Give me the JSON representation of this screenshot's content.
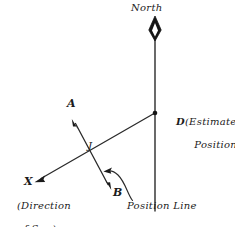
{
  "figure": {
    "background_color": "#ffffff",
    "ink_color": "#1b1b1b",
    "width": 235,
    "height": 227
  },
  "labels": {
    "north": "North",
    "point_a": "A",
    "point_j": "J",
    "point_b": "B",
    "point_x": "X",
    "point_d_letter": "D",
    "point_d_paren_line1": "(Estimated",
    "point_d_paren_line2": "Position)",
    "sun_line1": "(Direction",
    "sun_line2": "of Sun)",
    "position_line": "Position Line"
  },
  "geometry": {
    "north_line": {
      "x": 155,
      "y_top": 36,
      "y_bottom": 211
    },
    "compass_needle": {
      "cx": 155,
      "cy_top": 17,
      "cy_bottom": 40,
      "half_width": 6
    },
    "point_d": {
      "x": 155,
      "y": 113
    },
    "point_j": {
      "x": 95,
      "y": 155
    },
    "sun_ray": {
      "x1": 155,
      "y1": 113,
      "x2": 35,
      "y2": 182
    },
    "position_line_ab": {
      "ax": 72,
      "ay": 120,
      "bx": 110,
      "by": 189
    },
    "leader_curve": {
      "from_x": 133,
      "from_y": 200,
      "to_x": 106,
      "to_y": 171
    }
  },
  "icons": {
    "compass_needle": "compass-needle-icon",
    "arrow_a": "arrow-head-icon",
    "arrow_b": "arrow-head-icon",
    "arrow_x": "arrow-head-icon",
    "leader_arrow": "curved-arrow-icon"
  }
}
